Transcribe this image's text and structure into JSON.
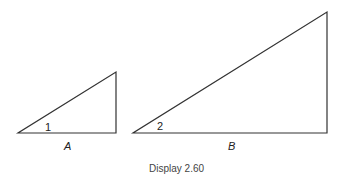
{
  "triangles": [
    {
      "name": "A",
      "angle_label": "1",
      "points": "18,133 116,133 116,72"
    },
    {
      "name": "B",
      "angle_label": "2",
      "points": "133,133 327,133 327,12"
    }
  ],
  "caption": "Display 2.60",
  "colors": {
    "stroke": "#333333"
  }
}
